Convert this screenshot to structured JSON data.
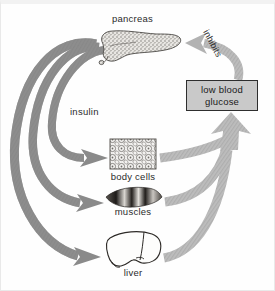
{
  "diagram": {
    "colors": {
      "insulin_arrow": "#8c8c8c",
      "glucose_arrow": "#b6b6b6",
      "inhibit_arrow": "#b0b0b0",
      "box_fill": "#c9c9c9",
      "box_border": "#2e2e2e",
      "label_text": "#2b2b2b",
      "background": "#fefefe"
    },
    "labels": {
      "pancreas": "pancreas",
      "insulin": "insulin",
      "body_cells": "body cells",
      "muscles": "muscles",
      "liver": "liver",
      "inhibits": "inhibits"
    },
    "box": {
      "line1": "low blood",
      "line2": "glucose"
    },
    "organs": [
      {
        "name": "pancreas",
        "label": "pancreas",
        "icon": "pancreas-organ-icon"
      },
      {
        "name": "body_cells",
        "label": "body cells",
        "icon": "body-cells-tissue-icon"
      },
      {
        "name": "muscles",
        "label": "muscles",
        "icon": "muscle-fibre-icon"
      },
      {
        "name": "liver",
        "label": "liver",
        "icon": "liver-organ-icon"
      }
    ],
    "arrows": [
      {
        "name": "insulin-to-body-cells",
        "from": "pancreas",
        "to": "body cells",
        "label": "insulin"
      },
      {
        "name": "insulin-to-muscles",
        "from": "pancreas",
        "to": "muscles",
        "label": "insulin"
      },
      {
        "name": "insulin-to-liver",
        "from": "pancreas",
        "to": "liver",
        "label": "insulin"
      },
      {
        "name": "body-cells-to-glucose",
        "from": "body cells",
        "to": "low blood glucose",
        "label": ""
      },
      {
        "name": "muscles-to-glucose",
        "from": "muscles",
        "to": "low blood glucose",
        "label": ""
      },
      {
        "name": "liver-to-glucose",
        "from": "liver",
        "to": "low blood glucose",
        "label": ""
      },
      {
        "name": "glucose-inhibits-pancreas",
        "from": "low blood glucose",
        "to": "pancreas",
        "label": "inhibits"
      }
    ]
  }
}
